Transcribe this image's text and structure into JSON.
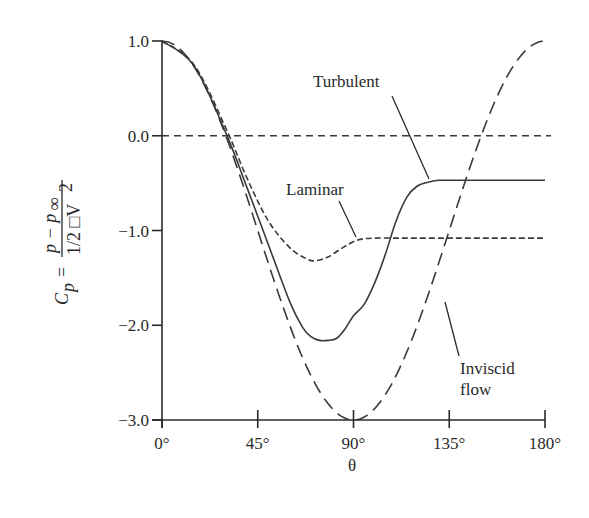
{
  "chart_data": {
    "type": "line",
    "title": "",
    "xlabel": "θ",
    "ylabel": "C_p = (p − p∞) / (1/2 □V²)",
    "ylabel_parts": {
      "lhs": "C",
      "lhs_sub": "p",
      "eq": "=",
      "numerator": "p − p",
      "numerator_sub": "∞",
      "denominator": "1/2 □V",
      "denominator_sup": "2"
    },
    "xlim": [
      0,
      180
    ],
    "ylim": [
      -3.0,
      1.0
    ],
    "grid": false,
    "legend": "inline annotations",
    "x_ticks": [
      0,
      45,
      90,
      135,
      180
    ],
    "x_tick_labels": [
      "0°",
      "45°",
      "90°",
      "135°",
      "180°"
    ],
    "y_ticks": [
      1.0,
      0.0,
      -1.0,
      -2.0,
      -3.0
    ],
    "y_tick_labels": [
      "1.0",
      "0.0",
      "−1.0",
      "−2.0",
      "−3.0"
    ],
    "reference_line": {
      "y": 0.0,
      "style": "short-dash",
      "x_range": [
        0,
        180
      ]
    },
    "series": [
      {
        "name": "Inviscid flow",
        "style": "long-dash",
        "formula": "1 - 4 sin^2(θ)",
        "x": [
          0,
          15,
          30,
          45,
          60,
          75,
          90,
          105,
          120,
          135,
          150,
          165,
          180
        ],
        "values": [
          1.0,
          0.73,
          0.0,
          -1.0,
          -2.0,
          -2.73,
          -3.0,
          -2.73,
          -2.0,
          -1.0,
          0.0,
          0.73,
          1.0
        ]
      },
      {
        "name": "Laminar",
        "style": "short-dash",
        "x": [
          0,
          15,
          30,
          40,
          50,
          60,
          68,
          72,
          78,
          85,
          92,
          100,
          110,
          120,
          135,
          150,
          165,
          180
        ],
        "values": [
          1.0,
          0.75,
          0.08,
          -0.45,
          -0.9,
          -1.18,
          -1.3,
          -1.32,
          -1.28,
          -1.18,
          -1.1,
          -1.08,
          -1.08,
          -1.08,
          -1.08,
          -1.08,
          -1.08,
          -1.08
        ]
      },
      {
        "name": "Turbulent",
        "style": "solid",
        "x": [
          0,
          15,
          30,
          40,
          50,
          60,
          66,
          70,
          74,
          78,
          82,
          86,
          90,
          95,
          100,
          105,
          110,
          115,
          120,
          125,
          130,
          135,
          150,
          165,
          180
        ],
        "values": [
          1.0,
          0.74,
          0.03,
          -0.55,
          -1.15,
          -1.75,
          -2.02,
          -2.12,
          -2.16,
          -2.16,
          -2.14,
          -2.04,
          -1.9,
          -1.78,
          -1.55,
          -1.25,
          -0.9,
          -0.65,
          -0.53,
          -0.49,
          -0.47,
          -0.47,
          -0.47,
          -0.47,
          -0.47
        ]
      }
    ],
    "annotations": [
      {
        "text": "Turbulent",
        "target_series": "Turbulent"
      },
      {
        "text": "Laminar",
        "target_series": "Laminar"
      },
      {
        "text": "Inviscid",
        "target_series": "Inviscid flow"
      },
      {
        "text": "flow",
        "target_series": "Inviscid flow"
      }
    ]
  },
  "colors": {
    "ink": "#2a2a2a",
    "curve": "#3a3a3a",
    "background": "#ffffff"
  }
}
